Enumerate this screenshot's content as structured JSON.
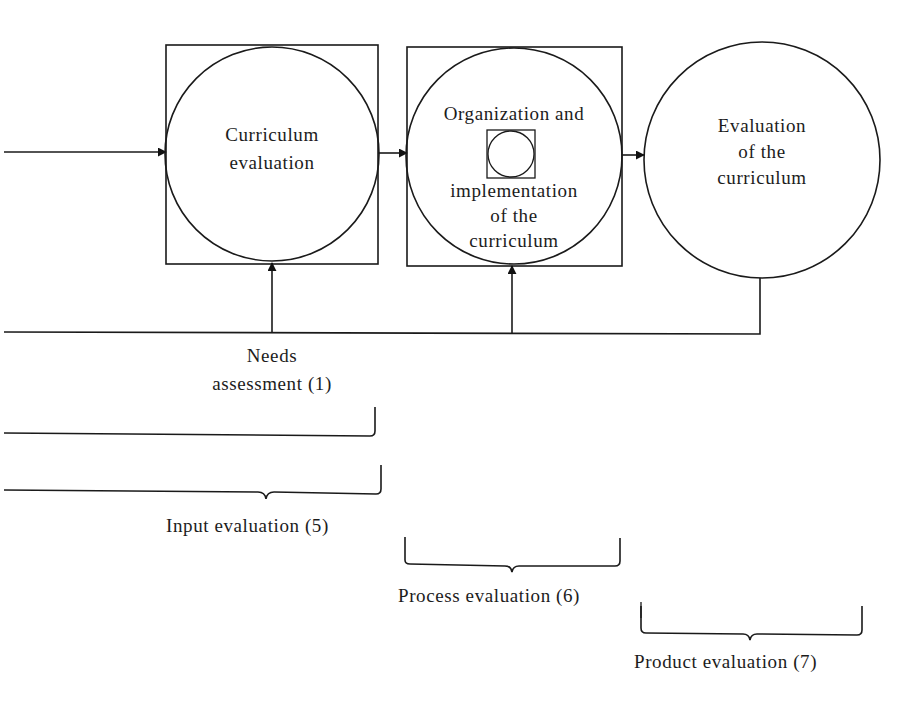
{
  "diagram": {
    "type": "flow-diagram",
    "stages": [
      {
        "id": "curriculum-evaluation",
        "lines": [
          "Curriculum",
          "evaluation"
        ],
        "shape": "circle-in-square"
      },
      {
        "id": "organization-implementation",
        "lines": [
          "Organization and",
          "implementation",
          "of the",
          "curriculum"
        ],
        "shape": "circle-in-square",
        "inner_icon": "small-circle-in-square"
      },
      {
        "id": "evaluation-of-curriculum",
        "lines": [
          "Evaluation",
          "of the",
          "curriculum"
        ],
        "shape": "circle"
      }
    ],
    "feedback": {
      "label_lines": [
        "Needs",
        "assessment (1)"
      ]
    },
    "brackets": [
      {
        "id": "input",
        "label": "Input evaluation (5)"
      },
      {
        "id": "process",
        "label": "Process evaluation (6)"
      },
      {
        "id": "product",
        "label": "Product evaluation (7)"
      }
    ],
    "colors": {
      "ink": "#1a1a1a",
      "paper": "#ffffff"
    }
  }
}
